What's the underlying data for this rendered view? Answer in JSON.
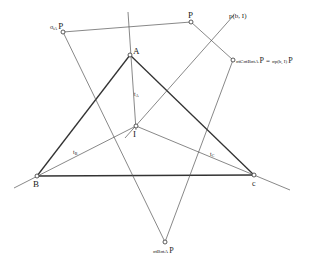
{
  "diagram": {
    "points": {
      "A": {
        "label": "A",
        "x": 130,
        "y": 55
      },
      "B": {
        "label": "B",
        "x": 37,
        "y": 176
      },
      "C": {
        "label": "c",
        "x": 254,
        "y": 175
      },
      "I": {
        "label": "I",
        "x": 136,
        "y": 126
      },
      "P": {
        "label": "P",
        "x": 191,
        "y": 22
      },
      "sA_P": {
        "label_sigma": "σ",
        "label_sub": "tA",
        "label_main": "P",
        "x": 63,
        "y": 32
      },
      "sBsA_P": {
        "label_text": "σtBσtA",
        "label_main": "P",
        "x": 165,
        "y": 242
      },
      "sCsBsA_P": {
        "label_left": "σtCσtBσtA",
        "label_main": "P",
        "label_eq": "=",
        "label_right": "σp(b, I)",
        "label_right_main": "P",
        "x": 233,
        "y": 60
      }
    },
    "lines": {
      "tA": {
        "label": "tA",
        "label_t": "t",
        "label_sub": "A"
      },
      "tB": {
        "label": "tB",
        "label_t": "t",
        "label_sub": "B"
      },
      "tC": {
        "label": "tC",
        "label_t": "t",
        "label_sub": "C"
      },
      "p_b_I": {
        "label": "p(b, I)"
      }
    }
  }
}
